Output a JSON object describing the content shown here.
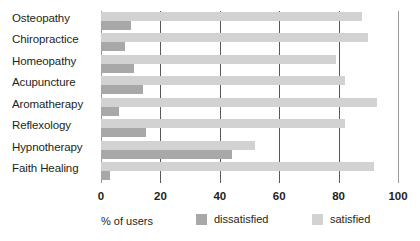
{
  "chart_data": {
    "type": "bar",
    "orientation": "horizontal",
    "title": "",
    "xlabel": "% of users",
    "ylabel": "",
    "xlim": [
      0,
      100
    ],
    "xticks": [
      0,
      20,
      40,
      60,
      80,
      100
    ],
    "grid": true,
    "legend_position": "bottom",
    "categories": [
      "Osteopathy",
      "Chiropractice",
      "Homeopathy",
      "Acupuncture",
      "Aromatherapy",
      "Reflexology",
      "Hypnotherapy",
      "Faith Healing"
    ],
    "series": [
      {
        "name": "satisfied",
        "color": "#d2d2d2",
        "values": [
          88,
          90,
          79,
          82,
          93,
          82,
          52,
          92
        ]
      },
      {
        "name": "dissatisfied",
        "color": "#a8a8a8",
        "values": [
          10,
          8,
          11,
          14,
          6,
          15,
          44,
          3
        ]
      }
    ]
  },
  "axis": {
    "x_title": "% of users",
    "tick_labels": [
      "0",
      "20",
      "40",
      "60",
      "80",
      "100"
    ]
  },
  "legend": {
    "items": [
      {
        "label": "dissatisfied",
        "color": "#a8a8a8"
      },
      {
        "label": "satisfied",
        "color": "#d2d2d2"
      }
    ]
  }
}
